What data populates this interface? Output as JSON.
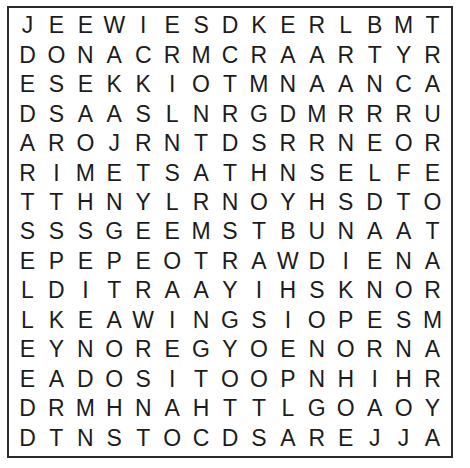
{
  "puzzle": {
    "type": "word-search",
    "title": "Word Search Grid",
    "rows": 15,
    "columns": 15,
    "border_color": "#2b2b2b",
    "letter_color": "#1c1c1c",
    "background_color": "#ffffff",
    "grid": [
      [
        "J",
        "E",
        "E",
        "W",
        "I",
        "E",
        "S",
        "D",
        "K",
        "E",
        "R",
        "L",
        "B",
        "M",
        "T"
      ],
      [
        "D",
        "O",
        "N",
        "A",
        "C",
        "R",
        "M",
        "C",
        "R",
        "A",
        "A",
        "R",
        "T",
        "Y",
        "R"
      ],
      [
        "E",
        "S",
        "E",
        "K",
        "K",
        "I",
        "O",
        "T",
        "M",
        "N",
        "A",
        "A",
        "N",
        "C",
        "A"
      ],
      [
        "D",
        "S",
        "A",
        "A",
        "S",
        "L",
        "N",
        "R",
        "G",
        "D",
        "M",
        "R",
        "R",
        "R",
        "U"
      ],
      [
        "A",
        "R",
        "O",
        "J",
        "R",
        "N",
        "T",
        "D",
        "S",
        "R",
        "R",
        "N",
        "E",
        "O",
        "R"
      ],
      [
        "R",
        "I",
        "M",
        "E",
        "T",
        "S",
        "A",
        "T",
        "H",
        "N",
        "S",
        "E",
        "L",
        "F",
        "E"
      ],
      [
        "T",
        "T",
        "H",
        "N",
        "Y",
        "L",
        "R",
        "N",
        "O",
        "Y",
        "H",
        "S",
        "D",
        "T",
        "O"
      ],
      [
        "S",
        "S",
        "S",
        "G",
        "E",
        "E",
        "M",
        "S",
        "T",
        "B",
        "U",
        "N",
        "A",
        "A",
        "T"
      ],
      [
        "E",
        "P",
        "E",
        "P",
        "E",
        "O",
        "T",
        "R",
        "A",
        "W",
        "D",
        "I",
        "E",
        "N",
        "A"
      ],
      [
        "L",
        "D",
        "I",
        "T",
        "R",
        "A",
        "A",
        "Y",
        "I",
        "H",
        "S",
        "K",
        "N",
        "O",
        "R"
      ],
      [
        "L",
        "K",
        "E",
        "A",
        "W",
        "I",
        "N",
        "G",
        "S",
        "I",
        "O",
        "P",
        "E",
        "S",
        "M"
      ],
      [
        "E",
        "Y",
        "N",
        "O",
        "R",
        "E",
        "G",
        "Y",
        "O",
        "E",
        "N",
        "O",
        "R",
        "N",
        "A"
      ],
      [
        "E",
        "A",
        "D",
        "O",
        "S",
        "I",
        "T",
        "O",
        "O",
        "P",
        "N",
        "H",
        "I",
        "H",
        "R"
      ],
      [
        "D",
        "R",
        "M",
        "H",
        "N",
        "A",
        "H",
        "T",
        "T",
        "L",
        "G",
        "O",
        "A",
        "O",
        "Y"
      ],
      [
        "D",
        "T",
        "N",
        "S",
        "T",
        "O",
        "C",
        "D",
        "S",
        "A",
        "R",
        "E",
        "J",
        "J",
        "A"
      ]
    ]
  }
}
